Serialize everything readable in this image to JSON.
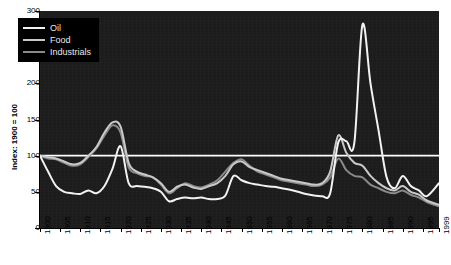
{
  "chart_data": {
    "type": "line",
    "title": "",
    "xlabel": "",
    "ylabel": "Index: 1900 = 100",
    "ylim": [
      0,
      300
    ],
    "xlim": [
      1900,
      1999
    ],
    "yticks": [
      0,
      50,
      100,
      150,
      200,
      250,
      300
    ],
    "xticks": [
      1900,
      1905,
      1910,
      1915,
      1920,
      1925,
      1930,
      1935,
      1940,
      1945,
      1950,
      1955,
      1960,
      1965,
      1970,
      1975,
      1980,
      1985,
      1990,
      1995,
      1999
    ],
    "grid": false,
    "legend_position": "top-left",
    "reference_line": {
      "value": 100,
      "color": "#ffffff",
      "label": ""
    },
    "background_color": "#1c1c1c",
    "x": [
      1900,
      1902,
      1904,
      1906,
      1908,
      1910,
      1912,
      1914,
      1916,
      1918,
      1920,
      1922,
      1924,
      1926,
      1928,
      1930,
      1932,
      1934,
      1936,
      1938,
      1940,
      1942,
      1944,
      1946,
      1948,
      1950,
      1952,
      1954,
      1956,
      1958,
      1960,
      1962,
      1964,
      1966,
      1968,
      1970,
      1972,
      1974,
      1976,
      1978,
      1980,
      1982,
      1984,
      1986,
      1988,
      1990,
      1992,
      1994,
      1996,
      1999
    ],
    "series": [
      {
        "name": "Oil",
        "color": "#f2f2f2",
        "values": [
          100,
          78,
          58,
          50,
          48,
          47,
          52,
          48,
          58,
          82,
          113,
          62,
          58,
          57,
          55,
          50,
          37,
          40,
          42,
          41,
          42,
          40,
          40,
          45,
          72,
          66,
          62,
          60,
          58,
          57,
          55,
          53,
          50,
          47,
          45,
          44,
          48,
          118,
          120,
          118,
          281,
          200,
          135,
          70,
          55,
          72,
          58,
          52,
          44,
          62
        ]
      },
      {
        "name": "Food",
        "color": "#c9c9c9",
        "values": [
          100,
          98,
          96,
          92,
          88,
          90,
          100,
          112,
          132,
          146,
          140,
          90,
          78,
          74,
          70,
          62,
          50,
          57,
          60,
          56,
          54,
          58,
          62,
          72,
          88,
          92,
          84,
          80,
          76,
          72,
          68,
          66,
          64,
          62,
          60,
          62,
          78,
          128,
          104,
          90,
          86,
          72,
          62,
          55,
          52,
          58,
          50,
          46,
          38,
          32
        ]
      },
      {
        "name": "Industrials",
        "color": "#8a8a8a",
        "values": [
          100,
          96,
          95,
          90,
          86,
          88,
          98,
          110,
          128,
          142,
          132,
          84,
          76,
          72,
          70,
          60,
          48,
          55,
          62,
          58,
          56,
          60,
          66,
          78,
          90,
          95,
          86,
          78,
          74,
          70,
          66,
          64,
          62,
          60,
          58,
          60,
          70,
          96,
          80,
          72,
          70,
          60,
          55,
          50,
          48,
          52,
          46,
          42,
          36,
          30
        ]
      }
    ]
  },
  "legend": {
    "items": [
      {
        "label": "Oil",
        "color": "#f2f2f2"
      },
      {
        "label": "Food",
        "color": "#c9c9c9"
      },
      {
        "label": "Industrials",
        "color": "#8a8a8a"
      }
    ]
  },
  "axes": {
    "y_title": "Index: 1900 = 100",
    "y_tick_labels": [
      "300",
      "250",
      "200",
      "150",
      "100",
      "50",
      "0"
    ],
    "x_tick_labels": [
      "1900",
      "1905",
      "1910",
      "1915",
      "1920",
      "1925",
      "1930",
      "1935",
      "1940",
      "1945",
      "1950",
      "1955",
      "1960",
      "1965",
      "1970",
      "1975",
      "1980",
      "1985",
      "1990",
      "1995",
      "1999"
    ]
  }
}
